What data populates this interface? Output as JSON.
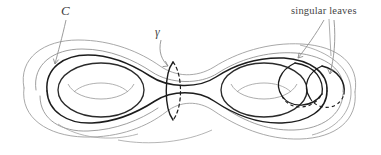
{
  "figure": {
    "kind": "genus-2-surface-diagram",
    "background_color": "#ffffff",
    "labels": {
      "singular_leaves": "singular leaves",
      "curve_C": "C",
      "curve_gamma": "γ"
    },
    "colors": {
      "silhouette": "#9a9a9a",
      "dark_curve": "#1e1e1e",
      "mid_curve": "#6e6e6e",
      "hole_inner": "#8e8e8e",
      "leader": "#8a8a8a",
      "text": "#454545",
      "dashed": "#1e1e1e"
    },
    "elements": {
      "outer_silhouette": "genus-2 outline",
      "left_hole": "left torus hole ellipse",
      "right_hole": "right torus hole ellipse",
      "neck_circle": "gamma separating circle",
      "C_curve": "curve C encircling left handle",
      "singular_leaf_1": "first singular leaf circle",
      "singular_leaf_2": "second singular leaf circle",
      "leader_C": "leader line from C label",
      "leader_gamma": "leader line from gamma label",
      "leader_sl_1": "leader line to first singular leaf",
      "leader_sl_2": "leader line to second singular leaf"
    }
  }
}
